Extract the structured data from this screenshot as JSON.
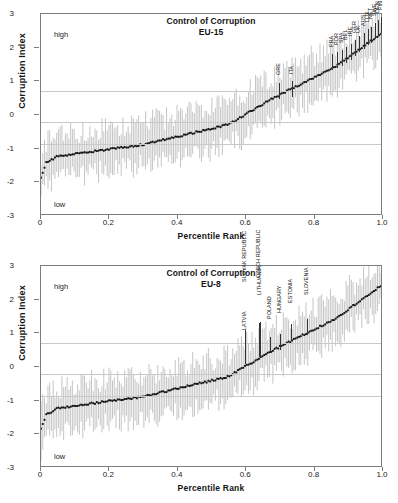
{
  "figure": {
    "axis_color": "#7d7d7d",
    "grid_color": "#c9c9c9",
    "point_color": "#111111",
    "interval_color": "#c4c4c4",
    "background": "#ffffff"
  },
  "charts": [
    {
      "id": "eu15",
      "title": "Control of Corruption",
      "subtitle": "EU-15",
      "xlabel": "Percentile Rank",
      "ylabel": "Corruption Index",
      "high_label": "high",
      "low_label": "low",
      "ylim": [
        -3,
        3
      ],
      "xlim": [
        0,
        1
      ],
      "yticks": [
        3,
        2,
        1,
        0,
        -1,
        -2,
        -3
      ],
      "ytick_labels": [
        "3",
        "2",
        "1",
        "0",
        "-1",
        "-2",
        "-3"
      ],
      "xticks": [
        0,
        0.2,
        0.4,
        0.6,
        0.8,
        1.0
      ],
      "xtick_labels": [
        "0",
        "0.2",
        "0.4",
        "0.6",
        "0.8",
        "1.0"
      ],
      "gridlines": [
        0.7,
        -0.22,
        -0.85
      ],
      "type": "scatter",
      "series_name": "Point estimate with 90% confidence interval",
      "highlights": [
        {
          "label": "GRE",
          "x": 0.7,
          "y": 0.46
        },
        {
          "label": "ITA",
          "x": 0.738,
          "y": 0.5
        },
        {
          "label": "FRA",
          "x": 0.855,
          "y": 1.31
        },
        {
          "label": "POR",
          "x": 0.868,
          "y": 1.37
        },
        {
          "label": "SPA",
          "x": 0.882,
          "y": 1.43
        },
        {
          "label": "BEL",
          "x": 0.896,
          "y": 1.52
        },
        {
          "label": "IRE",
          "x": 0.91,
          "y": 1.62
        },
        {
          "label": "GER",
          "x": 0.922,
          "y": 1.73
        },
        {
          "label": "UK",
          "x": 0.934,
          "y": 1.83
        },
        {
          "label": "AUS",
          "x": 0.946,
          "y": 1.93
        },
        {
          "label": "LUX",
          "x": 0.958,
          "y": 2.04
        },
        {
          "label": "NET",
          "x": 0.968,
          "y": 2.12
        },
        {
          "label": "SWE",
          "x": 0.978,
          "y": 2.22
        },
        {
          "label": "DEN",
          "x": 0.988,
          "y": 2.31
        },
        {
          "label": "FIN",
          "x": 0.998,
          "y": 2.4
        }
      ]
    },
    {
      "id": "eu8",
      "title": "Control of Corruption",
      "subtitle": "EU-8",
      "xlabel": "Percentile Rank",
      "ylabel": "Corruption Index",
      "high_label": "high",
      "low_label": "low",
      "ylim": [
        -3,
        3
      ],
      "xlim": [
        0,
        1
      ],
      "yticks": [
        3,
        2,
        1,
        0,
        -1,
        -2,
        -3
      ],
      "ytick_labels": [
        "3",
        "2",
        "1",
        "0",
        "-1",
        "-2",
        "-3"
      ],
      "xticks": [
        0,
        0.2,
        0.4,
        0.6,
        0.8,
        1.0
      ],
      "xtick_labels": [
        "0",
        "0.2",
        "0.4",
        "0.6",
        "0.8",
        "1.0"
      ],
      "gridlines": [
        0.7,
        -0.22,
        -0.85
      ],
      "type": "scatter",
      "series_name": "Point estimate with 90% confidence interval",
      "highlights": [
        {
          "label": "SLOVAK REPUBLIC",
          "x": 0.598,
          "y": 0.06
        },
        {
          "label": "LATVIA",
          "x": 0.6,
          "y": 0.07
        },
        {
          "label": "CZECH REPUBLIC",
          "x": 0.64,
          "y": 0.27
        },
        {
          "label": "LITHUANIA",
          "x": 0.642,
          "y": 0.29
        },
        {
          "label": "POLAND",
          "x": 0.672,
          "y": 0.4
        },
        {
          "label": "HUNGARY",
          "x": 0.702,
          "y": 0.48
        },
        {
          "label": "ESTONIA",
          "x": 0.735,
          "y": 0.78
        },
        {
          "label": "SLOVENIA",
          "x": 0.78,
          "y": 0.92
        }
      ]
    }
  ]
}
